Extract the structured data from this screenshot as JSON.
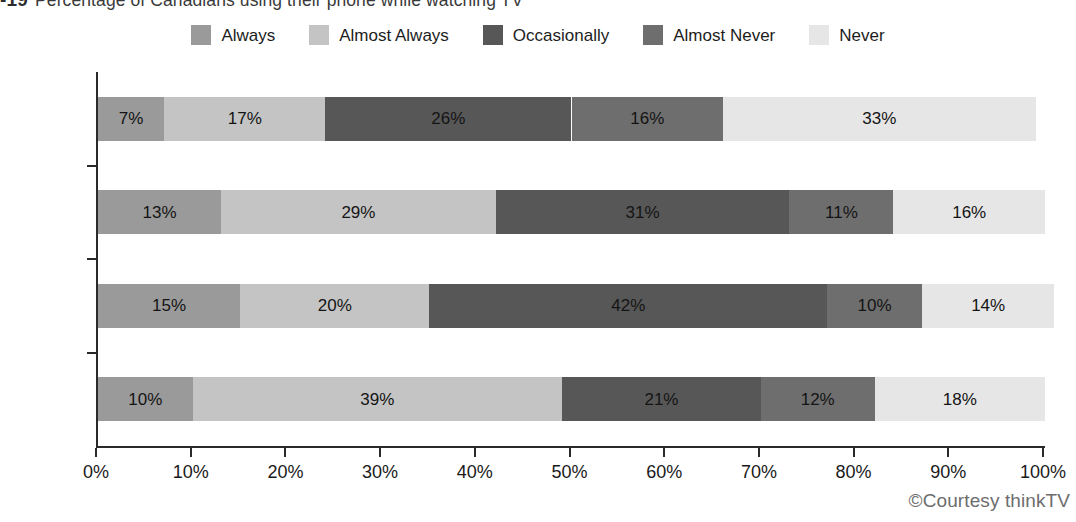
{
  "title": {
    "number": "-19",
    "text": "Percentage of Canadians using their phone while watching TV"
  },
  "credit": "©Courtesy thinkTV",
  "legend": {
    "position": "top-center",
    "items": [
      {
        "label": "Always",
        "color": "#9a9a9a"
      },
      {
        "label": "Almost Always",
        "color": "#c4c4c4"
      },
      {
        "label": "Occasionally",
        "color": "#575757"
      },
      {
        "label": "Almost Never",
        "color": "#6e6e6e"
      },
      {
        "label": "Never",
        "color": "#e6e6e6"
      }
    ]
  },
  "axes": {
    "x": {
      "label": "",
      "min": 0,
      "max": 100,
      "tick_labels": [
        "0%",
        "10%",
        "20%",
        "30%",
        "40%",
        "50%",
        "60%",
        "70%",
        "80%",
        "90%",
        "100%"
      ],
      "tick_values": [
        0,
        10,
        20,
        30,
        40,
        50,
        60,
        70,
        80,
        90,
        100
      ]
    },
    "y": {
      "label": "",
      "tick_labels": [
        "A18+",
        "A18–34",
        "M18–34",
        "F18–34"
      ]
    }
  },
  "chart_data": {
    "type": "bar",
    "orientation": "horizontal",
    "stacked": true,
    "stack_mode": "percent",
    "title": "Percentage of Canadians using their phone while watching TV",
    "xlabel": "",
    "ylabel": "",
    "xlim": [
      0,
      100
    ],
    "grid": false,
    "legend_position": "top-center",
    "categories": [
      "A18+",
      "A18–34",
      "M18–34",
      "F18–34"
    ],
    "series": [
      {
        "name": "Always",
        "color": "#9a9a9a",
        "values": [
          7,
          13,
          15,
          10
        ],
        "labels": [
          "7%",
          "13%",
          "15%",
          "10%"
        ]
      },
      {
        "name": "Almost Always",
        "color": "#c4c4c4",
        "values": [
          17,
          29,
          20,
          39
        ],
        "labels": [
          "17%",
          "29%",
          "20%",
          "39%"
        ]
      },
      {
        "name": "Occasionally",
        "color": "#575757",
        "values": [
          26,
          31,
          42,
          21
        ],
        "labels": [
          "26%",
          "31%",
          "42%",
          "21%"
        ]
      },
      {
        "name": "Almost Never",
        "color": "#6e6e6e",
        "values": [
          16,
          11,
          10,
          12
        ],
        "labels": [
          "16%",
          "11%",
          "10%",
          "12%"
        ]
      },
      {
        "name": "Never",
        "color": "#e6e6e6",
        "values": [
          33,
          16,
          14,
          18
        ],
        "labels": [
          "33%",
          "16%",
          "14%",
          "18%"
        ]
      }
    ]
  }
}
